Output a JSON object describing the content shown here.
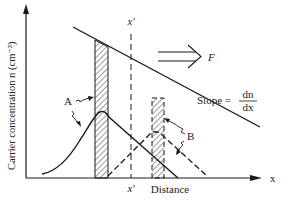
{
  "diagram": {
    "type": "carrier-diffusion",
    "y_axis_label": "Carrier concentration n (cm⁻³)",
    "x_axis_label": "Distance",
    "x_axis_symbol": "x",
    "x_prime_top": "x'",
    "x_prime_bottom": "x'",
    "force_label": "F",
    "slope_label": "Slope =",
    "slope_numerator": "dn",
    "slope_denominator": "dx",
    "curve_a_label": "A",
    "curve_b_label": "B",
    "colors": {
      "line": "#1a1a1a",
      "background": "#ffffff"
    }
  }
}
